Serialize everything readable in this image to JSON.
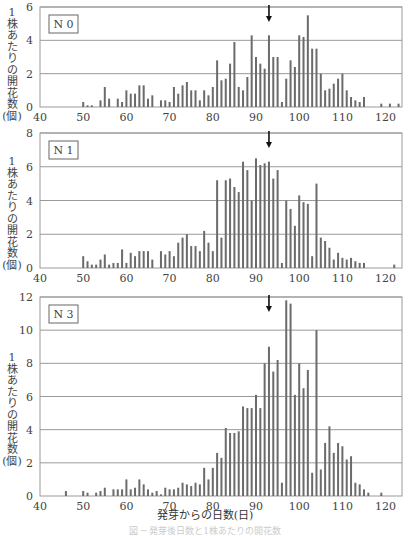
{
  "xlabel": "発芽からの日数(日)",
  "caption": "図 ─ 発芽後日数と1株あたりの開花数",
  "ylabel_chars": [
    "1",
    "株",
    "あ",
    "た",
    "り",
    "の",
    "開",
    "花",
    "数",
    "(個)"
  ],
  "arrow_day": 93,
  "colors": {
    "bar": "#6b6b6b",
    "grid": "#9a9a9a",
    "frame": "#9a9a9a",
    "arrow": "#111111"
  },
  "chart_data": [
    {
      "type": "bar",
      "title": "N 0",
      "xlabel": "発芽からの日数(日)",
      "ylabel": "1株あたりの開花数(個)",
      "xlim": [
        40,
        124
      ],
      "ylim": [
        0,
        6
      ],
      "xticks": [
        40,
        50,
        60,
        70,
        80,
        90,
        100,
        110,
        120
      ],
      "yticks": [
        0,
        2,
        4,
        6
      ],
      "grid": true,
      "annotation": "arrow at day 93",
      "x": [
        50,
        51,
        52,
        54,
        55,
        56,
        58,
        59,
        60,
        61,
        62,
        63,
        64,
        65,
        66,
        68,
        69,
        70,
        71,
        72,
        73,
        74,
        75,
        76,
        77,
        78,
        79,
        80,
        81,
        82,
        83,
        84,
        85,
        86,
        87,
        88,
        89,
        90,
        91,
        92,
        93,
        94,
        95,
        96,
        97,
        98,
        99,
        100,
        101,
        102,
        103,
        104,
        105,
        106,
        107,
        108,
        109,
        110,
        111,
        112,
        113,
        114,
        115,
        119,
        121,
        123
      ],
      "values": [
        0.3,
        0.1,
        0.1,
        0.4,
        1.2,
        0.5,
        0.5,
        0.3,
        1.0,
        0.8,
        0.8,
        1.3,
        1.3,
        0.5,
        0.7,
        0.4,
        0.4,
        0.3,
        1.2,
        0.8,
        1.3,
        1.5,
        1.0,
        1.0,
        0.4,
        1.0,
        0.7,
        1.2,
        2.8,
        1.6,
        1.7,
        2.6,
        3.9,
        1.2,
        1.0,
        1.8,
        4.3,
        3.0,
        2.6,
        2.3,
        4.3,
        3.0,
        3.0,
        0.3,
        1.7,
        2.8,
        2.4,
        4.3,
        4.2,
        5.5,
        3.5,
        3.5,
        2.0,
        1.0,
        1.1,
        1.4,
        1.7,
        2.0,
        1.0,
        0.6,
        0.4,
        0.3,
        0.6,
        0.2,
        0.2,
        0.2
      ]
    },
    {
      "type": "bar",
      "title": "N 1",
      "xlabel": "発芽からの日数(日)",
      "ylabel": "1株あたりの開花数(個)",
      "xlim": [
        40,
        124
      ],
      "ylim": [
        0,
        8
      ],
      "xticks": [
        40,
        50,
        60,
        70,
        80,
        90,
        100,
        110,
        120
      ],
      "yticks": [
        0,
        2,
        4,
        6,
        8
      ],
      "grid": true,
      "annotation": "arrow at day 93",
      "x": [
        50,
        51,
        52,
        53,
        54,
        55,
        56,
        57,
        58,
        59,
        60,
        61,
        62,
        63,
        64,
        65,
        66,
        68,
        69,
        70,
        71,
        72,
        73,
        74,
        75,
        76,
        77,
        78,
        79,
        80,
        81,
        82,
        83,
        84,
        85,
        86,
        87,
        88,
        89,
        90,
        91,
        92,
        93,
        94,
        95,
        96,
        97,
        98,
        99,
        100,
        101,
        102,
        103,
        104,
        105,
        106,
        107,
        108,
        109,
        110,
        111,
        112,
        113,
        114,
        115,
        122
      ],
      "values": [
        0.7,
        0.4,
        0.2,
        0.2,
        0.5,
        0.8,
        0.2,
        0.3,
        0.3,
        1.1,
        0.3,
        0.9,
        0.7,
        1.0,
        1.0,
        1.0,
        0.5,
        1.0,
        0.8,
        1.0,
        0.7,
        1.5,
        1.8,
        2.0,
        1.3,
        1.3,
        1.0,
        2.2,
        1.5,
        1.0,
        5.2,
        1.8,
        5.2,
        5.3,
        4.8,
        4.5,
        6.3,
        5.8,
        4.0,
        6.5,
        6.1,
        6.2,
        6.3,
        5.3,
        5.8,
        0.3,
        4.0,
        3.5,
        2.5,
        4.3,
        3.9,
        3.8,
        0.7,
        5.0,
        1.8,
        1.6,
        1.2,
        0.5,
        0.9,
        0.6,
        0.5,
        0.6,
        0.4,
        0.3,
        0.3,
        0.2
      ]
    },
    {
      "type": "bar",
      "title": "N 3",
      "xlabel": "発芽からの日数(日)",
      "ylabel": "1株あたりの開花数(個)",
      "xlim": [
        40,
        124
      ],
      "ylim": [
        0,
        12
      ],
      "xticks": [
        40,
        50,
        60,
        70,
        80,
        90,
        100,
        110,
        120
      ],
      "yticks": [
        0,
        2,
        4,
        6,
        8,
        10,
        12
      ],
      "grid": true,
      "annotation": "arrow at day 93",
      "x": [
        46,
        50,
        51,
        53,
        54,
        55,
        57,
        58,
        59,
        60,
        61,
        62,
        63,
        64,
        65,
        66,
        67,
        68,
        69,
        70,
        71,
        72,
        73,
        74,
        75,
        76,
        77,
        78,
        79,
        80,
        81,
        82,
        83,
        84,
        85,
        86,
        87,
        88,
        89,
        90,
        91,
        92,
        93,
        94,
        95,
        96,
        97,
        98,
        99,
        100,
        101,
        102,
        103,
        104,
        105,
        106,
        107,
        108,
        109,
        110,
        111,
        112,
        113,
        114,
        115,
        116,
        119
      ],
      "values": [
        0.3,
        0.3,
        0.2,
        0.2,
        0.3,
        0.5,
        0.4,
        0.4,
        0.4,
        1.0,
        0.4,
        0.5,
        1.0,
        0.7,
        0.4,
        0.2,
        0.3,
        0.1,
        0.5,
        0.4,
        0.4,
        0.5,
        0.8,
        0.7,
        0.6,
        0.8,
        0.7,
        1.7,
        1.0,
        1.7,
        2.6,
        2.3,
        4.1,
        3.8,
        3.8,
        3.9,
        5.4,
        5.3,
        5.3,
        6.1,
        5.3,
        8.0,
        9.0,
        7.5,
        8.2,
        0.8,
        11.8,
        11.6,
        6.1,
        8.0,
        6.5,
        7.6,
        1.4,
        10.0,
        1.6,
        3.2,
        4.2,
        2.6,
        3.2,
        3.0,
        2.2,
        2.4,
        0.8,
        0.7,
        0.4,
        0.2,
        0.2
      ]
    }
  ]
}
